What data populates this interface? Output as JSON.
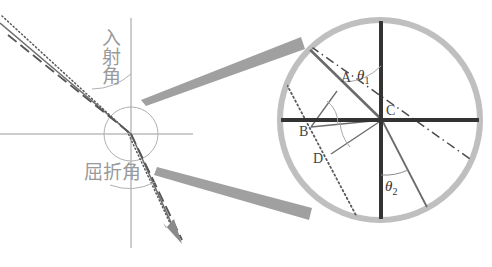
{
  "figure": {
    "left_diagram": {
      "labels": {
        "incidence_angle": "入射角",
        "refraction_angle": "屈折角"
      },
      "axes": {
        "horizontal_y": 134,
        "vertical_x": 131,
        "origin_x": 131,
        "origin_y": 134
      },
      "small_circle": {
        "cx": 131,
        "cy": 134,
        "r": 27
      },
      "rays": {
        "incident_solid": {
          "x1": 0,
          "y1": 22,
          "x2": 131,
          "y2": 134
        },
        "refracted_solid": {
          "x1": 131,
          "y1": 134,
          "x2": 179,
          "y2": 241
        },
        "dashdot": {
          "x1": 10,
          "y1": 38,
          "x2": 180,
          "y2": 240
        },
        "dotted": {
          "x1": 4,
          "y1": 19,
          "x2": 176,
          "y2": 239
        },
        "arrow_tip_x": 180,
        "arrow_tip_y": 241
      }
    },
    "magnifier_cone": {
      "upper": {
        "x1": 142,
        "y1": 99,
        "x2": 300,
        "y2": 38
      },
      "lower": {
        "x1": 157,
        "y1": 168,
        "x2": 311,
        "y2": 214
      },
      "color": "#888888"
    },
    "inset": {
      "circle": {
        "cx": 380,
        "cy": 120,
        "r": 102,
        "stroke": "#b4b4b4",
        "width": 6
      },
      "center_label": "C",
      "points": [
        {
          "name": "A",
          "label": "A",
          "x": 344,
          "y": 82
        },
        {
          "name": "B",
          "label": "B",
          "x": 303,
          "y": 132
        },
        {
          "name": "C",
          "label": "C",
          "x": 389,
          "y": 112
        },
        {
          "name": "D",
          "label": "D",
          "x": 317,
          "y": 160
        }
      ],
      "angles": [
        {
          "name": "theta1",
          "label": "θ",
          "sub": "1",
          "x": 360,
          "y": 80
        },
        {
          "name": "theta2",
          "label": "θ",
          "sub": "2",
          "x": 388,
          "y": 190
        }
      ]
    },
    "colors": {
      "axis_dark": "#333333",
      "axis_light": "#9a9a9a",
      "circle_gray": "#b4b4b4",
      "cone_gray": "#8c8c8c",
      "text_gray": "#9a9a9a",
      "ink": "#555555",
      "background": "#ffffff"
    }
  }
}
